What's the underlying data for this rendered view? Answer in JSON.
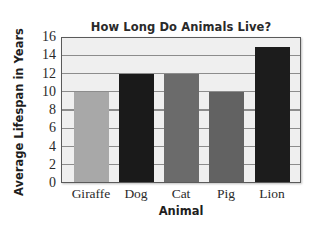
{
  "chart_data": {
    "type": "bar",
    "title": "How Long Do Animals Live?",
    "xlabel": "Animal",
    "ylabel": "Average Lifespan in Years",
    "categories": [
      "Giraffe",
      "Dog",
      "Cat",
      "Pig",
      "Lion"
    ],
    "values": [
      10,
      12,
      12,
      10,
      15
    ],
    "colors": [
      "#a8a8a8",
      "#1a1a1a",
      "#6b6b6b",
      "#626262",
      "#1c1c1c"
    ],
    "ylim": [
      0,
      16
    ],
    "yticks": [
      0,
      2,
      4,
      6,
      8,
      10,
      12,
      14,
      16
    ],
    "grid": true,
    "legend": null
  },
  "style": {
    "plot_background": "#efefef",
    "gridline_color": "#8c8c8c",
    "frame_color": "#5a5a5a"
  }
}
